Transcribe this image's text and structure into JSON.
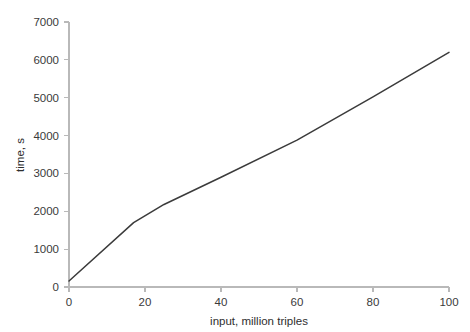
{
  "chart_data": {
    "type": "line",
    "title": "",
    "xlabel": "input, million triples",
    "ylabel": "time, s",
    "xlim": [
      0,
      100
    ],
    "ylim": [
      0,
      7000
    ],
    "xticks": [
      0,
      20,
      40,
      60,
      80,
      100
    ],
    "yticks": [
      0,
      1000,
      2000,
      3000,
      4000,
      5000,
      6000,
      7000
    ],
    "xtick_labels": [
      "0",
      "20",
      "40",
      "60",
      "80",
      "100"
    ],
    "ytick_labels": [
      "0",
      "1000",
      "2000",
      "3000",
      "4000",
      "5000",
      "6000",
      "7000"
    ],
    "grid": false,
    "legend": null,
    "line_color": "#3b3b3b",
    "axis_color": "#b9b9b9",
    "series": [
      {
        "name": "loading time",
        "x": [
          0,
          17,
          25,
          40,
          60,
          80,
          100
        ],
        "values": [
          160,
          1700,
          2180,
          2900,
          3880,
          5020,
          6200
        ]
      }
    ]
  }
}
